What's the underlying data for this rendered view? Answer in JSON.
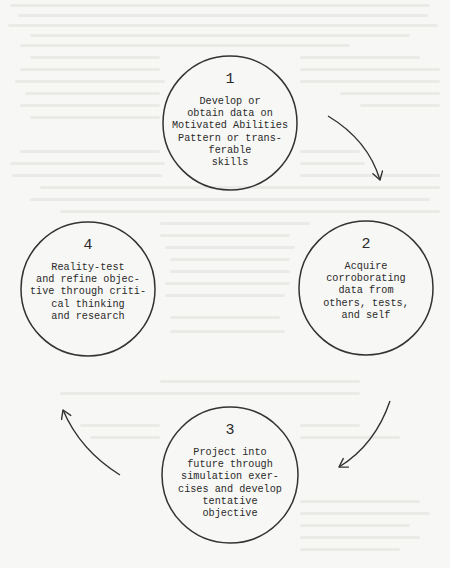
{
  "diagram": {
    "type": "cycle",
    "nodes": [
      {
        "number": "1",
        "text": "Develop or\nobtain data on\nMotivated Abilities\nPattern or trans-\nferable\nskills",
        "cx": 230,
        "cy": 123,
        "r": 67
      },
      {
        "number": "2",
        "text": "Acquire\ncorroborating\ndata from\nothers, tests,\nand self",
        "cx": 366,
        "cy": 288,
        "r": 67
      },
      {
        "number": "3",
        "text": "Project into\nfuture through\nsimulation exer-\ncises and develop\ntentative\nobjective",
        "cx": 230,
        "cy": 475,
        "r": 68
      },
      {
        "number": "4",
        "text": "Reality-test\nand refine objec-\ntive through criti-\ncal thinking\nand research",
        "cx": 88,
        "cy": 289,
        "r": 67
      }
    ],
    "edges": [
      {
        "from": "1",
        "to": "2",
        "direction": "clockwise"
      },
      {
        "from": "2",
        "to": "3",
        "direction": "clockwise"
      },
      {
        "from": "3",
        "to": "4",
        "direction": "clockwise"
      }
    ],
    "colors": {
      "line": "#333333",
      "background": "#f7f7f5",
      "text": "#2a2a2a"
    }
  }
}
